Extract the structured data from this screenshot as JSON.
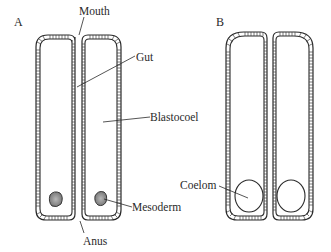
{
  "panels": [
    {
      "id": "A",
      "label": "A"
    },
    {
      "id": "B",
      "label": "B"
    }
  ],
  "labels": {
    "mouth": "Mouth",
    "gut": "Gut",
    "blastocoel": "Blastocoel",
    "mesoderm": "Mesoderm",
    "anus": "Anus",
    "coelom": "Coelom"
  },
  "colors": {
    "line": "#2a2a2a",
    "mesoderm_fill": "#9a9a9a",
    "background": "#ffffff"
  }
}
